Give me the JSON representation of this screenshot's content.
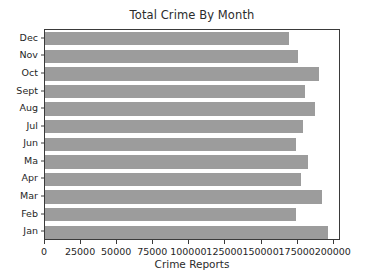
{
  "chart_data": {
    "type": "bar",
    "orientation": "horizontal",
    "title": "Total Crime By Month",
    "xlabel": "Crime Reports",
    "ylabel": "",
    "categories": [
      "Dec",
      "Nov",
      "Oct",
      "Sept",
      "Aug",
      "Jul",
      "Jun",
      "Ma",
      "Apr",
      "Mar",
      "Feb",
      "Jan"
    ],
    "values": [
      169000,
      175000,
      190000,
      180000,
      187000,
      179000,
      174000,
      182000,
      177000,
      192000,
      174000,
      196000
    ],
    "series": [
      {
        "name": "Crime Reports",
        "values": [
          169000,
          175000,
          190000,
          180000,
          187000,
          179000,
          174000,
          182000,
          177000,
          192000,
          174000,
          196000
        ]
      }
    ],
    "xlim": [
      0,
      205000
    ],
    "xticks": [
      0,
      25000,
      50000,
      75000,
      100000,
      125000,
      150000,
      175000,
      200000
    ],
    "xtick_labels": [
      "0",
      "25000",
      "50000",
      "75000",
      "100000",
      "125000",
      "150000",
      "175000",
      "200000"
    ],
    "ytick_labels": [
      "Dec",
      "Nov",
      "Oct",
      "Sept",
      "Aug",
      "Jul",
      "Jun",
      "Ma",
      "Apr",
      "Mar",
      "Feb",
      "Jan"
    ],
    "grid": false,
    "legend": false,
    "bar_color": "#9c9c9c",
    "axis_color": "#3a3a3a",
    "background": "#ffffff"
  }
}
